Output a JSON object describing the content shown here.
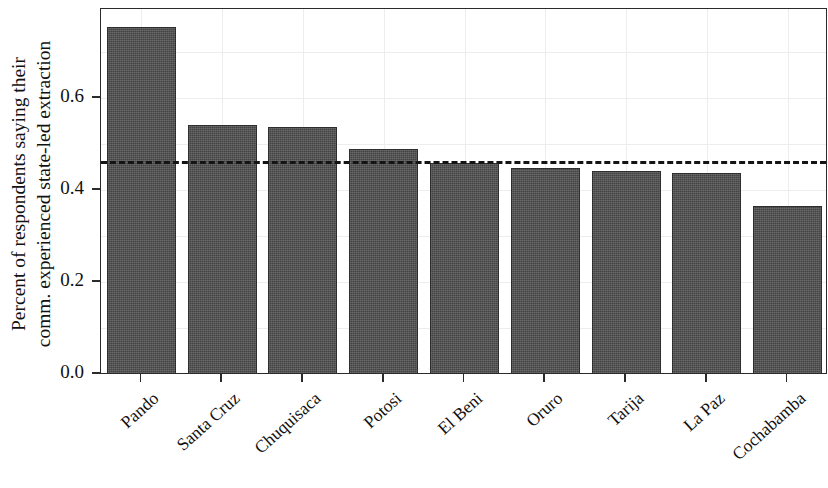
{
  "chart_data": {
    "type": "bar",
    "title": "",
    "subtitle": "",
    "xlabel": "",
    "ylabel": "Percent of respondents saying their comm. experienced state-led extraction",
    "ylabel_line1": "Percent of respondents saying their",
    "ylabel_line2": "comm. experienced state-led extraction",
    "categories": [
      "Pando",
      "Santa Cruz",
      "Chuquisaca",
      "Potosi",
      "El Beni",
      "Oruro",
      "Tarija",
      "La Paz",
      "Cochabamba"
    ],
    "values": [
      0.754,
      0.541,
      0.537,
      0.489,
      0.459,
      0.447,
      0.441,
      0.436,
      0.366
    ],
    "ytick_labels": [
      "0.0",
      "0.2",
      "0.4",
      "0.6"
    ],
    "ytick_values": [
      0.0,
      0.2,
      0.4,
      0.6
    ],
    "ylim": [
      0.0,
      0.795
    ],
    "xlim_note": "9 categorical bars",
    "grid": true,
    "legend": "none",
    "annotations": [
      {
        "name": "national-mean-reference-line",
        "type": "horizontal-dashed-line",
        "value": 0.462,
        "style": "dashed",
        "color": "#141414"
      }
    ],
    "bar_color": "#4b4b4b",
    "bar_edge_color": "#2e2e2e",
    "grid_color": "#ededed",
    "axis_color": "#2b2b2b",
    "background_color": "#ffffff"
  },
  "axes": {
    "y_ticks": [
      {
        "label": "0.0",
        "value": 0.0
      },
      {
        "label": "0.2",
        "value": 0.2
      },
      {
        "label": "0.4",
        "value": 0.4
      },
      {
        "label": "0.6",
        "value": 0.6
      }
    ],
    "x_ticks": [
      {
        "label": "Pando"
      },
      {
        "label": "Santa Cruz"
      },
      {
        "label": "Chuquisaca"
      },
      {
        "label": "Potosi"
      },
      {
        "label": "El Beni"
      },
      {
        "label": "Oruro"
      },
      {
        "label": "Tarija"
      },
      {
        "label": "La Paz"
      },
      {
        "label": "Cochabamba"
      }
    ]
  }
}
